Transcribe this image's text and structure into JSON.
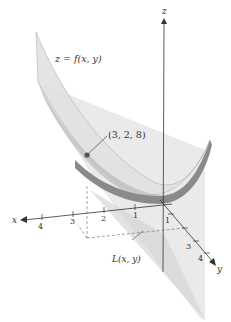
{
  "diagram": {
    "surface_label": "z = f(x, y)",
    "tangent_plane_label": "L(x, y)",
    "point_label": "(3, 2, 8)",
    "axes": {
      "x": {
        "label": "x",
        "ticks": [
          "4",
          "3",
          "2",
          "1"
        ]
      },
      "y": {
        "label": "y",
        "ticks": [
          "1",
          "3",
          "4"
        ]
      },
      "z": {
        "label": "z"
      }
    },
    "colors": {
      "surface_light": "#e4e4e4",
      "surface_mid": "#c8c8c8",
      "surface_dark": "#8a8a8a",
      "plane": "#d6d6d6",
      "axis": "#333333",
      "point": "#555555"
    }
  }
}
